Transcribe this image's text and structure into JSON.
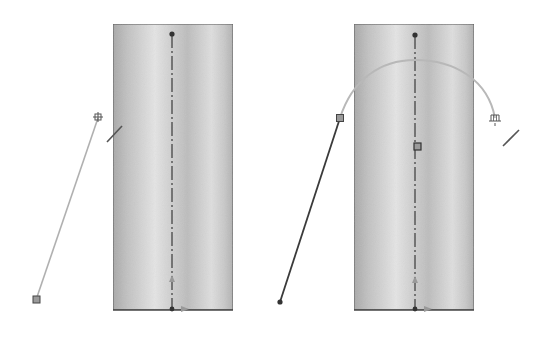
{
  "canvas": {
    "width": 535,
    "height": 344,
    "background": "#ffffff"
  },
  "colors": {
    "cylinder_edge": "#555555",
    "cylinder_light": "#e6e6e6",
    "cylinder_dark": "#a8a8a8",
    "axis": "#3a3a3a",
    "sketch_line_preview": "#b0b0b0",
    "sketch_line_solid": "#3a3a3a",
    "handle_fill": "#9a9a9a",
    "handle_stroke": "#444444",
    "arc": "#b8b8b8",
    "arrow": "#9a9a9a"
  },
  "panels": [
    {
      "id": "left",
      "cylinder": {
        "x": 113,
        "y": 24,
        "w": 120,
        "h": 286
      },
      "axis_x": 172,
      "sketch_line": {
        "x1": 36,
        "y1": 300,
        "x2": 98,
        "y2": 118,
        "style": "preview"
      },
      "start_handle": {
        "x": 36,
        "y": 300,
        "shape": "square"
      },
      "cursor_icon": {
        "x": 98,
        "y": 117,
        "name": "sketch-point-cursor"
      },
      "line_glyph": {
        "x1": 107,
        "y1": 142,
        "x2": 122,
        "y2": 126
      }
    },
    {
      "id": "right",
      "cylinder": {
        "x": 354,
        "y": 24,
        "w": 120,
        "h": 286
      },
      "axis_x": 415,
      "sketch_line": {
        "x1": 280,
        "y1": 302,
        "x2": 340,
        "y2": 118,
        "style": "solid"
      },
      "start_point": {
        "x": 280,
        "y": 302,
        "shape": "dot"
      },
      "mid_handle": {
        "x": 340,
        "y": 118,
        "shape": "square"
      },
      "center_handle": {
        "x": 418,
        "y": 147,
        "shape": "square"
      },
      "arc": {
        "x1": 340,
        "y1": 118,
        "cx": 415,
        "cy": 20,
        "x2": 495,
        "y2": 118
      },
      "cursor_icon": {
        "x": 495,
        "y": 118,
        "name": "sketch-arc-cursor"
      },
      "line_glyph": {
        "x1": 503,
        "y1": 146,
        "x2": 519,
        "y2": 130
      }
    }
  ]
}
